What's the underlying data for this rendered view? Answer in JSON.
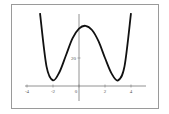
{
  "chart_data": {
    "type": "line",
    "title": "",
    "xlabel": "",
    "ylabel": "",
    "x_ticks": [
      "-4",
      "-2",
      "0",
      "2",
      "4"
    ],
    "y_ticks": [
      "20"
    ],
    "xlim": [
      -4.5,
      5
    ],
    "ylim": [
      -10,
      52
    ],
    "grid": false,
    "legend": null,
    "series": [
      {
        "name": "f(x)",
        "color": "#111111",
        "x": [
          -3,
          -2.5,
          -2,
          -1.5,
          -1,
          -0.5,
          0,
          0.5,
          1,
          1.5,
          2,
          2.5,
          3,
          3.5,
          4
        ],
        "y": [
          52,
          14,
          4,
          10,
          22,
          34,
          41,
          43,
          40,
          32,
          20,
          9,
          4,
          14,
          52
        ]
      }
    ]
  }
}
